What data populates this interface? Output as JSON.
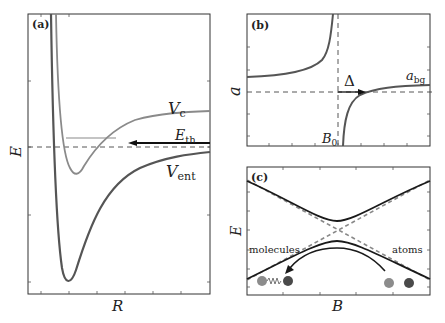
{
  "figure": {
    "panels": [
      {
        "tag": "(a)",
        "xlabel": "R",
        "ylabel": "E",
        "curves": [
          {
            "name": "V_c",
            "label_main": "V",
            "label_sub": "c",
            "color": "#8a8a8a"
          },
          {
            "name": "V_ent",
            "label_main": "V",
            "label_sub": "ent",
            "color": "#555555"
          }
        ],
        "threshold": {
          "label_main": "E",
          "label_sub": "th",
          "arrow_direction": "left"
        }
      },
      {
        "tag": "(b)",
        "xlabel": "",
        "ylabel": "a",
        "resonance_label_main": "B",
        "resonance_label_sub": "0",
        "width_label": "Δ",
        "background_label_main": "a",
        "background_label_sub": "bg"
      },
      {
        "tag": "(c)",
        "xlabel": "B",
        "ylabel": "E",
        "left_label": "molecules",
        "right_label": "atoms"
      }
    ],
    "colors": {
      "dark_curve": "#555555",
      "light_curve": "#8a8a8a",
      "black_curve": "#1a1a1a",
      "dashed": "#444444",
      "dashed_light": "#888888",
      "atom_light": "#8c8c8c",
      "atom_dark": "#4a4a4a"
    }
  }
}
